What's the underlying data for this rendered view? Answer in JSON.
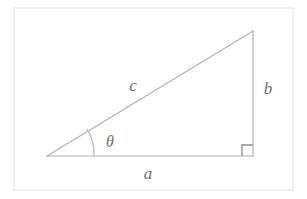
{
  "figure": {
    "type": "right-triangle-diagram",
    "canvas": {
      "width": 307,
      "height": 199,
      "background": "#ffffff"
    },
    "frame": {
      "name": "image-border",
      "x": 14,
      "y": 8,
      "width": 279,
      "height": 182,
      "stroke": "#ececec",
      "stroke_width": 1.5
    },
    "stroke_color": "#b2b2b2",
    "stroke_width": 1.2,
    "label_color": "#6e6e6e",
    "vertices": {
      "left": {
        "x": 47,
        "y": 156
      },
      "bottom_right": {
        "x": 253,
        "y": 156
      },
      "apex": {
        "x": 253,
        "y": 31
      }
    },
    "sides": [
      {
        "name": "adjacent-side",
        "label": "a",
        "path": "M 47 156 L 253 156",
        "label_x": 148,
        "label_y": 179
      },
      {
        "name": "opposite-side",
        "label": "b",
        "path": "M 253 156 L 253 31",
        "label_x": 268,
        "label_y": 94
      },
      {
        "name": "hypotenuse-side",
        "label": "c",
        "path": "M 47 156 L 253 31",
        "label_x": 133,
        "label_y": 91
      }
    ],
    "angle": {
      "name": "theta-angle",
      "label": "θ",
      "label_x": 104,
      "label_y": 147,
      "arc_path": "M 94 156 A 47 47 0 0 0 87 129",
      "radius": 47
    },
    "right_angle": {
      "name": "right-angle-marker",
      "path": "M 242 156 L 242 145 L 253 145",
      "size": 11
    }
  }
}
